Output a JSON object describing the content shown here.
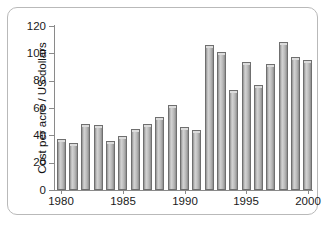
{
  "chart_data": {
    "type": "bar",
    "title": "",
    "subtitle": "",
    "xlabel": "",
    "ylabel": "Cost per acre / US dollars",
    "ylim": [
      0,
      120
    ],
    "xlim": [
      1979.4,
      2000.6
    ],
    "yticks": [
      0,
      20,
      40,
      60,
      80,
      100,
      120
    ],
    "ytick_labels": [
      "0",
      "20",
      "40",
      "60",
      "80",
      "100",
      "120"
    ],
    "xticks": [
      1980,
      1985,
      1990,
      1995,
      2000
    ],
    "xtick_labels": [
      "1980",
      "1985",
      "1990",
      "1995",
      "2000"
    ],
    "grid": false,
    "legend": false,
    "legend_position": "none",
    "bar_color": "#c0c0c0",
    "bar_edge_color": "#6f6f6f",
    "categories": [
      "1980",
      "1981",
      "1982",
      "1983",
      "1984",
      "1985",
      "1986",
      "1987",
      "1988",
      "1989",
      "1990",
      "1991",
      "1992",
      "1993",
      "1994",
      "1995",
      "1996",
      "1997",
      "1998",
      "1999",
      "2000"
    ],
    "values": [
      37,
      34.5,
      48,
      47.5,
      35.5,
      39.5,
      44.5,
      48.5,
      53.5,
      62.5,
      46,
      44,
      106,
      101,
      73,
      93.5,
      76.5,
      92,
      108,
      97.5,
      95
    ]
  },
  "figure": {
    "background": "#ffffff",
    "frame_border_color": "#b9b9b9"
  }
}
